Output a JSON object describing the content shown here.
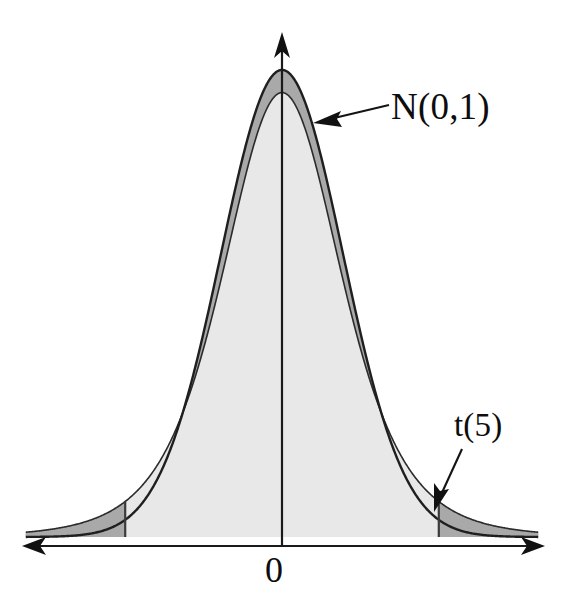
{
  "figure": {
    "background_color": "#ffffff",
    "axis_color": "#1a1a1a",
    "curve_color": "#1f1f1f",
    "fill_light": "#e8e8e8",
    "fill_dark": "#a9a9a9"
  },
  "annotations": {
    "normal_label": "N(0,1)",
    "t_label": "t(5)",
    "origin_label": "0"
  },
  "chart_data": {
    "type": "area",
    "title": "",
    "subtitle": "",
    "xlabel": "",
    "ylabel": "",
    "grid": false,
    "legend_position": "inline-annotations",
    "xlim": [
      -4.2,
      4.2
    ],
    "ylim": [
      0,
      0.42
    ],
    "xticks": [
      0
    ],
    "xticklabels": [
      "0"
    ],
    "yticks": [],
    "yticklabels": [],
    "axes": {
      "x_axis": {
        "arrow_both_ends": true,
        "drawn_from": -4.6,
        "drawn_to": 4.6
      },
      "y_axis": {
        "arrow_top": true,
        "at_x": 0,
        "drawn_to": 0.46
      }
    },
    "annotations": [
      {
        "text": "N(0,1)",
        "points_to": "normal-curve-right-shoulder",
        "arrow": "left",
        "x": 0.55,
        "y": 0.345
      },
      {
        "text": "t(5)",
        "points_to": "t-curve-right-tail",
        "arrow": "down-left",
        "x": 2.05,
        "y": 0.085
      },
      {
        "text": "0",
        "points_to": "origin",
        "arrow": "none",
        "x": 0,
        "y": 0
      }
    ],
    "shaded_regions": [
      {
        "name": "between-curves-center",
        "color": "#a9a9a9",
        "description": "Area between N(0,1) and t(5) near the peak where normal exceeds t"
      },
      {
        "name": "left-tail",
        "color": "#a9a9a9",
        "from": -4.2,
        "to": -2.57,
        "description": "Left tail of t(5) beyond critical value"
      },
      {
        "name": "right-tail",
        "color": "#a9a9a9",
        "from": 2.57,
        "to": 4.2,
        "description": "Right tail of t(5) beyond critical value"
      },
      {
        "name": "t-body",
        "color": "#e8e8e8",
        "from": -4.2,
        "to": 4.2,
        "description": "Full area under the t(5) density"
      }
    ],
    "critical_values": [
      -2.57,
      2.57
    ],
    "series": [
      {
        "name": "N(0,1)",
        "kind": "line",
        "filled": false,
        "peak_y": 0.3989,
        "x": [
          -4.2,
          -4.0,
          -3.8,
          -3.6,
          -3.4,
          -3.2,
          -3.0,
          -2.8,
          -2.6,
          -2.4,
          -2.2,
          -2.0,
          -1.8,
          -1.6,
          -1.4,
          -1.2,
          -1.0,
          -0.8,
          -0.6,
          -0.4,
          -0.2,
          0.0,
          0.2,
          0.4,
          0.6,
          0.8,
          1.0,
          1.2,
          1.4,
          1.6,
          1.8,
          2.0,
          2.2,
          2.4,
          2.6,
          2.8,
          3.0,
          3.2,
          3.4,
          3.6,
          3.8,
          4.0,
          4.2
        ],
        "y": [
          0.0001,
          0.0001,
          0.0003,
          0.0006,
          0.0012,
          0.0024,
          0.0044,
          0.0079,
          0.0136,
          0.0224,
          0.0355,
          0.054,
          0.079,
          0.1109,
          0.1497,
          0.1942,
          0.242,
          0.2897,
          0.3332,
          0.3683,
          0.391,
          0.3989,
          0.391,
          0.3683,
          0.3332,
          0.2897,
          0.242,
          0.1942,
          0.1497,
          0.1109,
          0.079,
          0.054,
          0.0355,
          0.0224,
          0.0136,
          0.0079,
          0.0044,
          0.0024,
          0.0012,
          0.0006,
          0.0003,
          0.0001,
          0.0001
        ]
      },
      {
        "name": "t(5)",
        "kind": "area",
        "filled": true,
        "peak_y": 0.3796,
        "x": [
          -4.2,
          -4.0,
          -3.8,
          -3.6,
          -3.4,
          -3.2,
          -3.0,
          -2.8,
          -2.6,
          -2.4,
          -2.2,
          -2.0,
          -1.8,
          -1.6,
          -1.4,
          -1.2,
          -1.0,
          -0.8,
          -0.6,
          -0.4,
          -0.2,
          0.0,
          0.2,
          0.4,
          0.6,
          0.8,
          1.0,
          1.2,
          1.4,
          1.6,
          1.8,
          2.0,
          2.2,
          2.4,
          2.6,
          2.8,
          3.0,
          3.2,
          3.4,
          3.6,
          3.8,
          4.0,
          4.2
        ],
        "y": [
          0.0051,
          0.0061,
          0.0073,
          0.0088,
          0.0107,
          0.013,
          0.0173,
          0.0208,
          0.0258,
          0.0323,
          0.0408,
          0.0512,
          0.0658,
          0.0851,
          0.1104,
          0.1428,
          0.1831,
          0.2307,
          0.2824,
          0.3322,
          0.3687,
          0.3796,
          0.3687,
          0.3322,
          0.2824,
          0.2307,
          0.1831,
          0.1428,
          0.1104,
          0.0851,
          0.0658,
          0.0512,
          0.0408,
          0.0323,
          0.0258,
          0.0208,
          0.0173,
          0.013,
          0.0107,
          0.0088,
          0.0073,
          0.0061,
          0.0051
        ]
      }
    ]
  }
}
